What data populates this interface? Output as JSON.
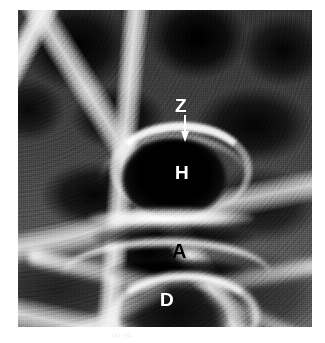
{
  "figure": {
    "kind": "radiograph",
    "modality_note": "grayscale radiographic plate",
    "caption_faint": "(a) NL"
  },
  "plate": {
    "background_color": "#4a4a4a",
    "page_color": "#ffffff"
  },
  "annotations": [
    {
      "id": "z",
      "label": "Z",
      "color": "#ffffff",
      "has_arrow": true,
      "arrow_direction": "down"
    },
    {
      "id": "h",
      "label": "H",
      "color": "#ffffff",
      "has_arrow": false,
      "arrow_direction": ""
    },
    {
      "id": "a",
      "label": "A",
      "color": "#000000",
      "has_arrow": false,
      "arrow_direction": ""
    },
    {
      "id": "d",
      "label": "D",
      "color": "#ffffff",
      "has_arrow": false,
      "arrow_direction": ""
    }
  ],
  "icons": {
    "arrow_down": "down-arrow-icon"
  }
}
